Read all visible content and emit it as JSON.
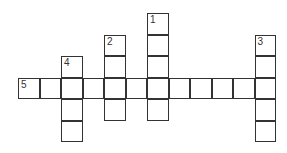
{
  "puzzle": {
    "type": "crossword",
    "cell_size": 21.5,
    "origin": {
      "x": 18,
      "y": 13
    },
    "cells": [
      {
        "col": 6,
        "row": 0,
        "number": "1"
      },
      {
        "col": 6,
        "row": 1
      },
      {
        "col": 6,
        "row": 2
      },
      {
        "col": 6,
        "row": 3
      },
      {
        "col": 6,
        "row": 4
      },
      {
        "col": 4,
        "row": 1,
        "number": "2"
      },
      {
        "col": 4,
        "row": 2
      },
      {
        "col": 4,
        "row": 3
      },
      {
        "col": 4,
        "row": 4
      },
      {
        "col": 11,
        "row": 1,
        "number": "3"
      },
      {
        "col": 11,
        "row": 2
      },
      {
        "col": 11,
        "row": 3
      },
      {
        "col": 11,
        "row": 4
      },
      {
        "col": 11,
        "row": 5
      },
      {
        "col": 2,
        "row": 2,
        "number": "4"
      },
      {
        "col": 2,
        "row": 3
      },
      {
        "col": 2,
        "row": 4
      },
      {
        "col": 2,
        "row": 5
      },
      {
        "col": 0,
        "row": 3,
        "number": "5"
      },
      {
        "col": 1,
        "row": 3
      },
      {
        "col": 3,
        "row": 3
      },
      {
        "col": 5,
        "row": 3
      },
      {
        "col": 7,
        "row": 3
      },
      {
        "col": 8,
        "row": 3
      },
      {
        "col": 9,
        "row": 3
      },
      {
        "col": 10,
        "row": 3
      }
    ],
    "entries": [
      {
        "number": "1",
        "direction": "down",
        "length": 5
      },
      {
        "number": "2",
        "direction": "down",
        "length": 4
      },
      {
        "number": "3",
        "direction": "down",
        "length": 5
      },
      {
        "number": "4",
        "direction": "down",
        "length": 4
      },
      {
        "number": "5",
        "direction": "across",
        "length": 12
      }
    ]
  }
}
